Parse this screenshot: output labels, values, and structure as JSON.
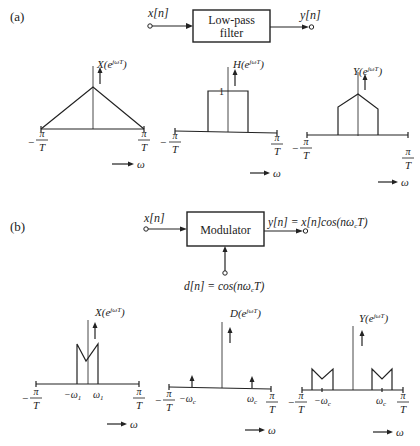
{
  "part_a": {
    "label": "(a)",
    "block": {
      "title_line1": "Low-pass",
      "title_line2": "filter",
      "input": "x[n]",
      "output": "y[n]"
    },
    "plots": [
      {
        "title_main": "X(e",
        "title_sup": "jωT",
        "title_close": ")",
        "shape": "triangle",
        "left_num": "π",
        "left_den": "T",
        "left_sign": "−",
        "right_num": "π",
        "right_den": "T"
      },
      {
        "title_main": "H(e",
        "title_sup": "jωT",
        "title_close": ")",
        "shape": "rectangle",
        "height_label": "1",
        "left_num": "π",
        "left_den": "T",
        "left_sign": "−",
        "right_num": "π",
        "right_den": "T"
      },
      {
        "title_main": "Y(e",
        "title_sup": "jωT",
        "title_close": ")",
        "shape": "truncated-triangle",
        "left_num": "π",
        "left_den": "T",
        "left_sign": "−",
        "right_num": "π",
        "right_den": "T"
      }
    ],
    "omega_label": "ω"
  },
  "part_b": {
    "label": "(b)",
    "block": {
      "title": "Modulator",
      "input": "x[n]",
      "output": "y[n] = x[n]cos(nω",
      "output_sub": "c",
      "output_tail": "T)",
      "carrier": "d[n] = cos(nω",
      "carrier_sub": "c",
      "carrier_tail": "T)"
    },
    "plots": [
      {
        "title_main": "X(e",
        "title_sup": "jωT",
        "title_close": ")",
        "shape": "M-band",
        "tick_neg": "−ω",
        "tick_neg_sub": "1",
        "tick_pos": "ω",
        "tick_pos_sub": "1",
        "left_num": "π",
        "left_den": "T",
        "left_sign": "−",
        "right_num": "π",
        "right_den": "T"
      },
      {
        "title_main": "D(e",
        "title_sup": "jωT",
        "title_close": ")",
        "shape": "impulses",
        "tick_neg": "−ω",
        "tick_neg_sub": "c",
        "tick_pos": "ω",
        "tick_pos_sub": "c",
        "left_num": "π",
        "left_den": "T",
        "left_sign": "−",
        "right_num": "π",
        "right_den": "T"
      },
      {
        "title_main": "Y(e",
        "title_sup": "jωT",
        "title_close": ")",
        "shape": "shifted-M-bands",
        "tick_neg": "−ω",
        "tick_neg_sub": "c",
        "tick_pos": "ω",
        "tick_pos_sub": "c",
        "left_num": "π",
        "left_den": "T",
        "left_sign": "−",
        "right_num": "π",
        "right_den": "T"
      }
    ],
    "omega_label": "ω"
  }
}
